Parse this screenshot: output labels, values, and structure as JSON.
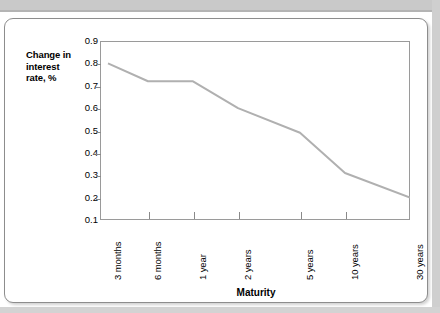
{
  "figure": {
    "y_axis_title": "Change in interest rate, %",
    "y_axis_title_lines": [
      "Change in",
      "interest",
      "rate, %"
    ],
    "x_axis_title": "Maturity"
  },
  "chart_data": {
    "type": "line",
    "title": "",
    "subtitle": "",
    "xlabel": "Maturity",
    "ylabel": "Change in interest rate, %",
    "categories": [
      "3 months",
      "6 months",
      "1 year",
      "2 years",
      "5 years",
      "10 years",
      "30 years"
    ],
    "values": [
      0.8,
      0.72,
      0.72,
      0.6,
      0.49,
      0.31,
      0.2
    ],
    "series": [
      {
        "name": "Change in interest rate",
        "values": [
          0.8,
          0.72,
          0.72,
          0.6,
          0.49,
          0.31,
          0.2
        ]
      }
    ],
    "ylim": [
      0.1,
      0.9
    ],
    "yticks": [
      0.9,
      0.8,
      0.7,
      0.6,
      0.5,
      0.4,
      0.3,
      0.2,
      0.1
    ],
    "ytick_labels": [
      "0.9",
      "0.8",
      "0.7",
      "0.6",
      "0.5",
      "0.4",
      "0.3",
      "0.2",
      "0.1"
    ],
    "grid": false,
    "legend": "none",
    "line_color": "#b0b0b0",
    "axis_color": "#9a9a9a",
    "background_color": "#ffffff"
  }
}
